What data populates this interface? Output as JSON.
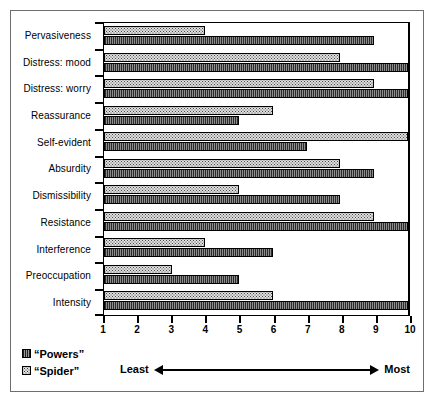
{
  "chart_data": {
    "type": "bar",
    "orientation": "horizontal",
    "title": "",
    "xlabel": "",
    "ylabel": "",
    "xlim": [
      1,
      10
    ],
    "xticks": [
      1,
      2,
      3,
      4,
      5,
      6,
      7,
      8,
      9,
      10
    ],
    "grid": false,
    "legend_position": "bottom-left",
    "categories": [
      "Pervasiveness",
      "Distress: mood",
      "Distress: worry",
      "Reassurance",
      "Self-evident",
      "Absurdity",
      "Dismissibility",
      "Resistance",
      "Interference",
      "Preoccupation",
      "Intensity"
    ],
    "series": [
      {
        "name": "“Spider”",
        "pattern": "dotted",
        "values": [
          4,
          8,
          9,
          6,
          10,
          8,
          5,
          9,
          4,
          3,
          6
        ]
      },
      {
        "name": "“Powers”",
        "pattern": "vertical-hatch",
        "values": [
          9,
          10,
          10,
          5,
          7,
          9,
          8,
          10,
          6,
          5,
          10
        ]
      }
    ],
    "annotations": {
      "least": "Least",
      "most": "Most"
    }
  },
  "legend": {
    "items": [
      {
        "label": "“Powers”",
        "swatch": "powers"
      },
      {
        "label": "“Spider”",
        "swatch": "spider"
      }
    ]
  },
  "scale_note": {
    "left_label": "Least",
    "right_label": "Most"
  },
  "caption": {
    "text": ""
  },
  "colors": {
    "powers_fill": "#4f4f4f",
    "spider_fill": "#dedede",
    "axis": "#000000",
    "frame": "#6e6e6e",
    "background": "#ffffff"
  }
}
